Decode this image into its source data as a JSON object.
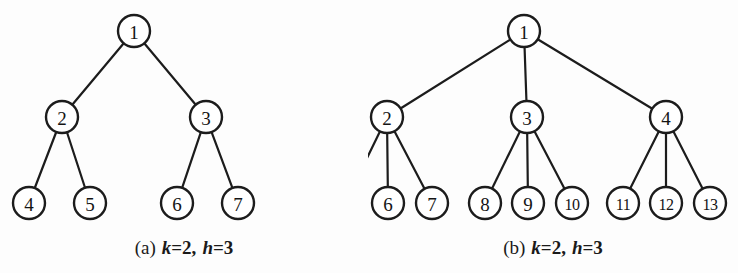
{
  "figures": [
    {
      "id": "figure-a",
      "caption": {
        "tag": "(a)",
        "param1_name": "k",
        "param1_value": "=2,",
        "param2_name": "h",
        "param2_value": "=3",
        "full_text": "(a) k=2, h=3"
      },
      "tree": {
        "type": "k-ary-tree",
        "k": 2,
        "h": 3,
        "node_radius": 16,
        "nodes": [
          {
            "label": "1",
            "x": 134,
            "y": 31
          },
          {
            "label": "2",
            "x": 62,
            "y": 117
          },
          {
            "label": "3",
            "x": 206,
            "y": 117
          },
          {
            "label": "4",
            "x": 29,
            "y": 203
          },
          {
            "label": "5",
            "x": 90,
            "y": 203
          },
          {
            "label": "6",
            "x": 177,
            "y": 203
          },
          {
            "label": "7",
            "x": 238,
            "y": 203
          }
        ],
        "edges": [
          {
            "from": "1",
            "to": "2"
          },
          {
            "from": "1",
            "to": "3"
          },
          {
            "from": "2",
            "to": "4"
          },
          {
            "from": "2",
            "to": "5"
          },
          {
            "from": "3",
            "to": "6"
          },
          {
            "from": "3",
            "to": "7"
          }
        ]
      }
    },
    {
      "id": "figure-b",
      "caption": {
        "tag": "(b)",
        "param1_name": "k",
        "param1_value": "=2,",
        "param2_name": "h",
        "param2_value": "=3",
        "full_text": "(b) k=2, h=3"
      },
      "tree": {
        "type": "k-ary-tree",
        "k": 2,
        "h": 3,
        "node_radius": 16,
        "nodes": [
          {
            "label": "1",
            "x": 156,
            "y": 31
          },
          {
            "label": "2",
            "x": 19,
            "y": 117
          },
          {
            "label": "3",
            "x": 159,
            "y": 117
          },
          {
            "label": "4",
            "x": 298,
            "y": 117
          },
          {
            "label": "5",
            "x": -23,
            "y": 203
          },
          {
            "label": "6",
            "x": 20,
            "y": 203
          },
          {
            "label": "7",
            "x": 64,
            "y": 203
          },
          {
            "label": "8",
            "x": 117,
            "y": 203
          },
          {
            "label": "9",
            "x": 160,
            "y": 203
          },
          {
            "label": "10",
            "x": 204,
            "y": 203
          },
          {
            "label": "11",
            "x": 255,
            "y": 203
          },
          {
            "label": "12",
            "x": 298,
            "y": 203
          },
          {
            "label": "13",
            "x": 342,
            "y": 203
          }
        ],
        "edges": [
          {
            "from": "1",
            "to": "2"
          },
          {
            "from": "1",
            "to": "3"
          },
          {
            "from": "1",
            "to": "4"
          },
          {
            "from": "2",
            "to": "5"
          },
          {
            "from": "2",
            "to": "6"
          },
          {
            "from": "2",
            "to": "7"
          },
          {
            "from": "3",
            "to": "8"
          },
          {
            "from": "3",
            "to": "9"
          },
          {
            "from": "3",
            "to": "10"
          },
          {
            "from": "4",
            "to": "11"
          },
          {
            "from": "4",
            "to": "12"
          },
          {
            "from": "4",
            "to": "13"
          }
        ]
      }
    }
  ],
  "colors": {
    "background": "#fdfdfd",
    "ink": "#1c1c1c",
    "node_fill": "#ffffff"
  }
}
